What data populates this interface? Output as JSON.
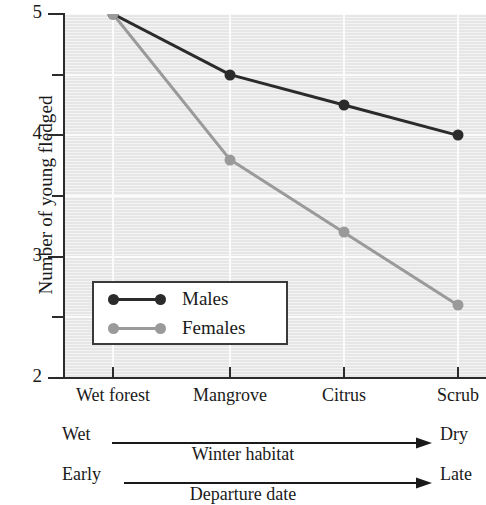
{
  "chart_data": {
    "type": "line",
    "title": "",
    "xlabel": "",
    "ylabel": "Number of young fledged",
    "categories": [
      "Wet forest",
      "Mangrove",
      "Citrus",
      "Scrub"
    ],
    "ylim": [
      2,
      5
    ],
    "yticks": [
      2,
      2.5,
      3,
      3.5,
      4,
      4.5,
      5
    ],
    "ytick_labels": [
      "2",
      "",
      "3",
      "",
      "4",
      "",
      "5"
    ],
    "grid": true,
    "legend_position": "lower left",
    "series": [
      {
        "name": "Males",
        "color": "#2b2b2b",
        "values": [
          5.0,
          4.5,
          4.25,
          4.0
        ]
      },
      {
        "name": "Females",
        "color": "#9a9a9a",
        "values": [
          5.0,
          3.8,
          3.2,
          2.6
        ]
      }
    ],
    "annotations": [
      {
        "label": "Winter habitat",
        "left_label": "Wet",
        "right_label": "Dry"
      },
      {
        "label": "Departure date",
        "left_label": "Early",
        "right_label": "Late"
      }
    ]
  }
}
